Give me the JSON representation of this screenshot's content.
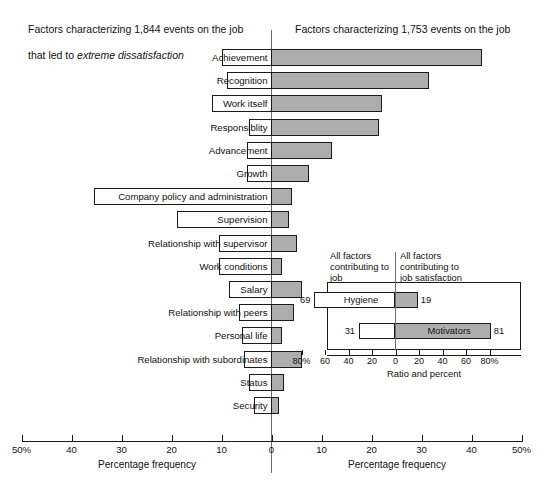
{
  "headings": {
    "left_line1": "Factors characterizing 1,844 events on the job",
    "left_line2": "that led to extreme dissatisfaction",
    "left_emph": "extreme dissatisfaction",
    "right_line1": "Factors characterizing 1,753 events on the job",
    "right_line2": "that led to extreme satisfaction",
    "right_emph": "extreme satisfaction"
  },
  "axis": {
    "title_left": "Percentage frequency",
    "title_right": "Percentage frequency",
    "tick_labels": [
      "50%",
      "40",
      "30",
      "20",
      "10",
      "0",
      "10",
      "20",
      "30",
      "40",
      "50%"
    ],
    "tick_values": [
      -50,
      -40,
      -30,
      -20,
      -10,
      0,
      10,
      20,
      30,
      40,
      50
    ]
  },
  "colors": {
    "satisfaction_fill": "#adadad",
    "dissatisfaction_fill": "#ffffff",
    "outline": "#1a1a1a",
    "axis": "#6d6d6d"
  },
  "inset": {
    "caption_left": "All factors\ncontributing to\njob dissatisfaction",
    "caption_right": "All factors\ncontributing to\njob satisfaction",
    "axis_title": "Ratio and percent",
    "tick_labels": [
      "80%",
      "60",
      "40",
      "20",
      "0",
      "20",
      "40",
      "60",
      "80%"
    ],
    "tick_values": [
      -80,
      -60,
      -40,
      -20,
      0,
      20,
      40,
      60,
      80
    ],
    "rows": [
      {
        "label": "Hygiene",
        "neg": 69,
        "pos": 19,
        "neg_text": "69",
        "pos_text": "19"
      },
      {
        "label": "Motivators",
        "neg": 31,
        "pos": 81,
        "neg_text": "31",
        "pos_text": "81"
      }
    ]
  },
  "chart_data": {
    "type": "bar",
    "orientation": "horizontal-diverging",
    "xlabel": "Percentage frequency",
    "ylabel": "",
    "xlim": [
      -50,
      50
    ],
    "grid": false,
    "legend": [
      "Factors characterizing events leading to extreme dissatisfaction",
      "Factors characterizing events leading to extreme satisfaction"
    ],
    "categories": [
      "Achievement",
      "Recognition",
      "Work itself",
      "Responsiblity",
      "Advancement",
      "Growth",
      "Company policy and administration",
      "Supervision",
      "Relationship with supervisor",
      "Work conditions",
      "Salary",
      "Relationship with peers",
      "Personal life",
      "Relationship with subordinates",
      "Status",
      "Security"
    ],
    "series": [
      {
        "name": "Extreme dissatisfaction",
        "values": [
          10,
          9,
          12,
          4.5,
          5,
          5,
          35.5,
          19,
          10.5,
          10.5,
          8.5,
          6.5,
          6,
          5.5,
          4.5,
          3.5
        ]
      },
      {
        "name": "Extreme satisfaction",
        "values": [
          42,
          31.5,
          22,
          21.5,
          12,
          7.5,
          4,
          3.5,
          5,
          2,
          6,
          4.5,
          2,
          6,
          2.5,
          1.5
        ]
      }
    ]
  }
}
